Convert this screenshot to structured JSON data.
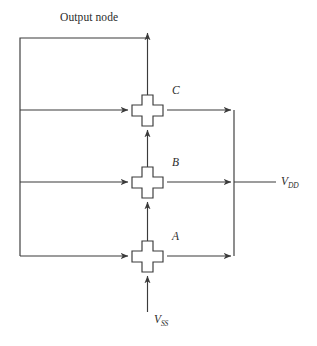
{
  "diagram": {
    "title": "Output node",
    "type": "pass-transistor-chain-schematic",
    "background_color": "#ffffff",
    "line_color": "#3a3a3a",
    "labels": {
      "output_node": "Output node",
      "vdd": "V",
      "vdd_sub": "DD",
      "vss": "V",
      "vss_sub": "SS"
    },
    "transistors": [
      {
        "id": "C",
        "label": "C",
        "cx": 147.5,
        "cy": 110
      },
      {
        "id": "B",
        "label": "B",
        "cx": 147.5,
        "cy": 182
      },
      {
        "id": "A",
        "label": "A",
        "cx": 147.5,
        "cy": 256
      }
    ],
    "nets": {
      "output_node_bus_x": 20,
      "output_node_top_y": 38,
      "supply_bus_x": 234,
      "supply_bus_top_y": 110,
      "supply_bus_bottom_y": 256,
      "vdd_rail_y": 182,
      "vdd_rail_end_x": 276,
      "vss_stub_x": 147.5,
      "vss_stub_bottom_y": 312
    }
  }
}
